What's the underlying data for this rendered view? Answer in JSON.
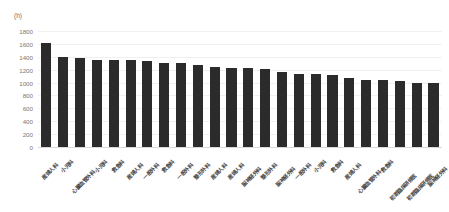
{
  "chart_data": {
    "type": "bar",
    "title": "",
    "subtitle": "",
    "unit_label": "(h)",
    "xlabel": "",
    "ylabel": "",
    "ylim": [
      0,
      1800
    ],
    "ytick_step": 200,
    "yticks": [
      1800,
      1600,
      1400,
      1200,
      1000,
      800,
      600,
      400,
      200,
      0
    ],
    "grid": true,
    "legend": "none",
    "bar_color": "#2b2b2b",
    "grid_color": "#f0f0f0",
    "axis_color": "#d9d9d9",
    "label_color": "#4a4a4a",
    "tick_color": "#777777",
    "categories": [
      "産婦人科",
      "小児科",
      "心臓血管外科",
      "小児科",
      "救急科",
      "産婦人科",
      "一般外科",
      "救急科",
      "一般外科",
      "整形外科",
      "産婦人科",
      "産婦人科",
      "脳神経外科",
      "整形外科",
      "脳神経外科",
      "一般外科",
      "小児科",
      "救急科",
      "産婦人科",
      "心臓血管外科",
      "救急科",
      "初期臨床研修医",
      "初期臨床研修医",
      "脳神経外科"
    ],
    "values": [
      1620,
      1400,
      1385,
      1355,
      1350,
      1355,
      1330,
      1310,
      1305,
      1265,
      1240,
      1230,
      1228,
      1205,
      1160,
      1140,
      1135,
      1120,
      1070,
      1035,
      1035,
      1020,
      1000,
      995
    ]
  }
}
